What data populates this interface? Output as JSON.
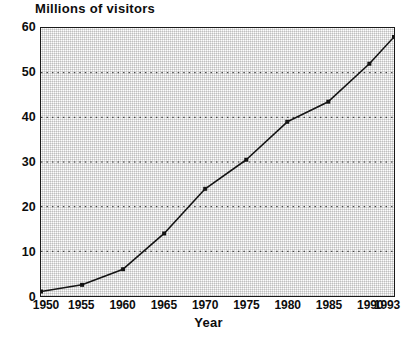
{
  "chart_data": {
    "type": "line",
    "title": "Millions of visitors",
    "xlabel": "Year",
    "ylabel": "",
    "categories": [
      "1950",
      "1955",
      "1960",
      "1965",
      "1970",
      "1975",
      "1980",
      "1985",
      "1990",
      "1993"
    ],
    "x": [
      1950,
      1955,
      1960,
      1965,
      1970,
      1975,
      1980,
      1985,
      1990,
      1993
    ],
    "values": [
      1,
      2.5,
      6,
      14,
      24,
      30.5,
      39,
      43.5,
      52,
      58
    ],
    "series": [
      {
        "name": "Millions of visitors",
        "values": [
          1,
          2.5,
          6,
          14,
          24,
          30.5,
          39,
          43.5,
          52,
          58
        ]
      }
    ],
    "ylim": [
      0,
      60
    ],
    "yticks": [
      0,
      10,
      20,
      30,
      40,
      50,
      60
    ],
    "ytick_labels": [
      "0",
      "10",
      "20",
      "30",
      "40",
      "50",
      "60"
    ],
    "xtick_labels": [
      "1950",
      "1955",
      "1960",
      "1965",
      "1970",
      "1975",
      "1980",
      "1985",
      "1990",
      "1993"
    ],
    "grid": "horizontal-dotted",
    "gridlines_at": [
      10,
      20,
      30,
      40,
      50
    ],
    "legend": "none",
    "marker": "square",
    "line_color": "#141414",
    "marker_color": "#141414",
    "plot_background": "#dedede",
    "frame_color": "#1a1a1a",
    "text_color": "#0d0d0d"
  }
}
